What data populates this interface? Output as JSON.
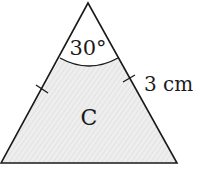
{
  "diagram": {
    "shape": "isosceles-triangle",
    "region_label": "C",
    "angle_label": "30°",
    "side_label": "3 cm",
    "colors": {
      "stroke": "#1a1a1a",
      "fill": "#ececec",
      "hatch": "#dcdcdc",
      "background": "#ffffff"
    }
  }
}
